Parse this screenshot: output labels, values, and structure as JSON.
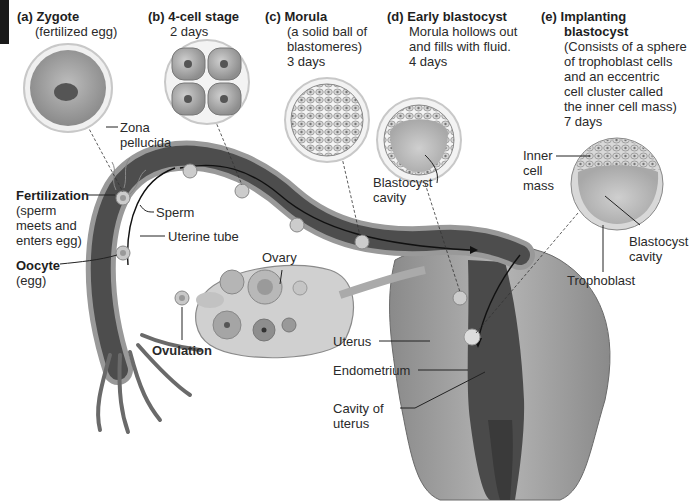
{
  "figure": {
    "stages": [
      {
        "id": "a",
        "letter": "(a)",
        "title": "Zygote",
        "lines": [
          "(fertilized egg)"
        ]
      },
      {
        "id": "b",
        "letter": "(b)",
        "title": "4-cell stage",
        "lines": [
          "2 days"
        ]
      },
      {
        "id": "c",
        "letter": "(c)",
        "title": "Morula",
        "lines": [
          "(a solid ball of",
          "blastomeres)",
          "3 days"
        ]
      },
      {
        "id": "d",
        "letter": "(d)",
        "title": "Early blastocyst",
        "lines": [
          "Morula hollows out",
          "and fills with fluid.",
          "4 days"
        ]
      },
      {
        "id": "e",
        "letter": "(e)",
        "title": "Implanting",
        "title2": "blastocyst",
        "lines": [
          "(Consists of a sphere",
          "of trophoblast cells",
          "and an eccentric",
          "cell cluster called",
          "the inner cell mass)",
          "7 days"
        ]
      }
    ],
    "labels": {
      "zona": [
        "Zona",
        "pellucida"
      ],
      "fertilization_title": "Fertilization",
      "fertilization_desc": [
        "(sperm",
        "meets and",
        "enters egg)"
      ],
      "sperm": "Sperm",
      "uterine_tube": "Uterine tube",
      "oocyte_title": "Oocyte",
      "oocyte_desc": "(egg)",
      "ovary": "Ovary",
      "ovulation": "Ovulation",
      "blastocyst_cavity_d": [
        "Blastocyst",
        "cavity"
      ],
      "inner_cell_mass": [
        "Inner",
        "cell",
        "mass"
      ],
      "blastocyst_cavity_e": [
        "Blastocyst",
        "cavity"
      ],
      "trophoblast": "Trophoblast",
      "uterus": "Uterus",
      "endometrium": "Endometrium",
      "cavity_of_uterus": [
        "Cavity of",
        "uterus"
      ]
    },
    "colors": {
      "tube_dark": "#4a4a4a",
      "tube_light": "#9a9a9a",
      "cell_fill": "#b8b8b8",
      "ring": "#d9d9d9",
      "text": "#222222"
    }
  }
}
